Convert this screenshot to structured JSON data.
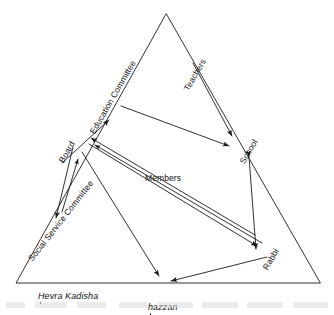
{
  "figure": {
    "shape": "triangle",
    "stroke_color": "#1a1a1a",
    "background": "#ffffff"
  },
  "nodes": [
    {
      "id": "education-committee",
      "label": "Education Committee",
      "x": 92,
      "y": 128,
      "rotation": -60,
      "style": "rotated"
    },
    {
      "id": "teachers",
      "label": "Teachers",
      "x": 186,
      "y": 85,
      "rotation": -60,
      "style": "rotated"
    },
    {
      "id": "school",
      "label": "School",
      "x": 242,
      "y": 158,
      "rotation": -60,
      "style": "rotated"
    },
    {
      "id": "board",
      "label": "Board",
      "x": 61,
      "y": 157,
      "rotation": -60,
      "style": "rotated"
    },
    {
      "id": "social-service-committee",
      "label": "Social Service Committee",
      "x": 30,
      "y": 255,
      "rotation": -52,
      "style": "rotated"
    },
    {
      "id": "members",
      "label": "Members",
      "x": 145,
      "y": 173,
      "rotation": 0,
      "style": "upright"
    },
    {
      "id": "rabbi",
      "label": "Rabbi",
      "x": 265,
      "y": 264,
      "rotation": -60,
      "style": "rotated"
    },
    {
      "id": "hevra-kadisha",
      "label": "Hevra Kadisha",
      "x": 38,
      "y": 291,
      "rotation": 0,
      "style": "italic-underdot"
    },
    {
      "id": "hazzan",
      "label": "hazzan",
      "x": 148,
      "y": 292,
      "rotation": 0,
      "style": "italic-underdot"
    }
  ],
  "edges": [
    {
      "id": "board-to-education-committee",
      "from": "board",
      "to": "education-committee",
      "arrow": "single"
    },
    {
      "id": "teachers-to-school",
      "from": "teachers",
      "to": "school",
      "arrow": "single"
    },
    {
      "id": "education-committee-to-school",
      "from": "education-committee",
      "to": "school",
      "arrow": "single"
    },
    {
      "id": "members-to-board",
      "from": "members",
      "to": "board",
      "arrow": "single"
    },
    {
      "id": "members-to-board-second",
      "from": "members",
      "to": "board",
      "arrow": "single"
    },
    {
      "id": "board-to-social-service-committee",
      "from": "board",
      "to": "social-service-committee",
      "arrow": "single"
    },
    {
      "id": "social-service-committee-to-board",
      "from": "social-service-committee",
      "to": "board",
      "arrow": "single"
    },
    {
      "id": "members-to-rabbi",
      "from": "members",
      "to": "rabbi",
      "arrow": "single"
    },
    {
      "id": "board-to-hazzan",
      "from": "board",
      "to": "hazzan",
      "arrow": "single"
    },
    {
      "id": "school-rabbi",
      "from": "school",
      "to": "rabbi",
      "arrow": "double"
    },
    {
      "id": "rabbi-to-hazzan",
      "from": "rabbi",
      "to": "hazzan",
      "arrow": "single"
    }
  ]
}
